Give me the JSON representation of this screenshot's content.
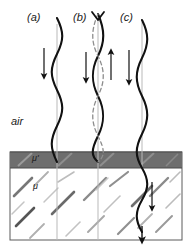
{
  "figure": {
    "title": "",
    "type": "physics-wave-boundary-diagram",
    "background_color": "#ffffff",
    "frame_color": "#555555"
  },
  "panels": [
    {
      "id": "a",
      "label": "(a)",
      "label_x": 27,
      "label_y": 12,
      "description": "traveling wave incident, downward arrow",
      "axis_x": 57,
      "arrow_direction": "down"
    },
    {
      "id": "b",
      "label": "(b)",
      "label_x": 74,
      "label_y": 12,
      "description": "standing wave with dashed envelope, down and up arrows",
      "axis_x": 98,
      "arrow_direction": "down-and-up"
    },
    {
      "id": "c",
      "label": "(c)",
      "label_x": 122,
      "label_y": 12,
      "description": "wave transmitted into medium, downward arrows",
      "axis_x": 142,
      "arrow_direction": "down"
    }
  ],
  "regions": {
    "air": {
      "label": "air",
      "label_x": 12,
      "label_y": 122,
      "fill": "#ffffff"
    },
    "boundary_strip": {
      "label": "μ'",
      "label_x": 34,
      "label_y": 155,
      "fill": "#6e6e6e",
      "top": 152,
      "height": 16
    },
    "medium": {
      "label": "μ",
      "label_x": 34,
      "label_y": 186,
      "fill": "#ffffff",
      "hatch_color": "#8a8a8a"
    }
  },
  "colors": {
    "wave_stroke": "#111111",
    "dashed_stroke": "#8d8d8d",
    "axis_line": "#b9b9b9",
    "arrow": "#111111",
    "strip_fill": "#6e6e6e",
    "hatch": "#909090",
    "frame": "#5a5a5a"
  }
}
